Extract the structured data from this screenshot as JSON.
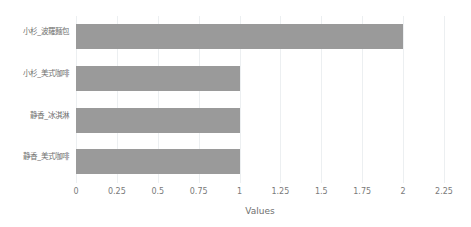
{
  "chart_data": {
    "type": "bar",
    "orientation": "horizontal",
    "title": "",
    "xlabel": "Values",
    "ylabel": "",
    "categories": [
      "小杉_波羅麵包",
      "小杉_美式咖啡",
      "静香_冰淇淋",
      "静香_美式咖啡"
    ],
    "values": [
      2,
      1,
      1,
      1
    ],
    "xlim": [
      0,
      2.25
    ],
    "xticks": [
      "0",
      "0.25",
      "0.5",
      "0.75",
      "1",
      "1.25",
      "1.5",
      "1.75",
      "2",
      "2.25"
    ],
    "xtick_values": [
      0,
      0.25,
      0.5,
      0.75,
      1,
      1.25,
      1.5,
      1.75,
      2,
      2.25
    ],
    "grid": "vertical",
    "legend": "none",
    "bar_color": "#9a9a9a",
    "gridline_color": "#eceff1",
    "background_color": "#ffffff"
  }
}
